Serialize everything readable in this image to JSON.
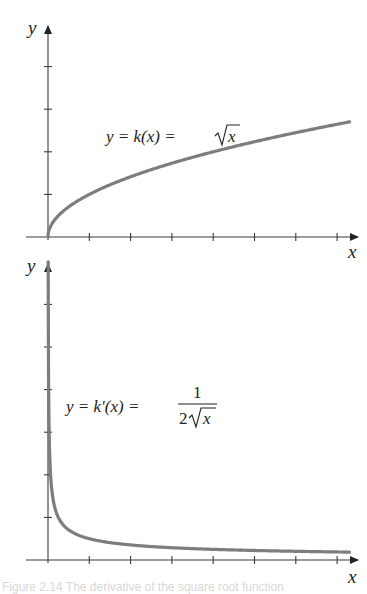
{
  "chart_data": [
    {
      "type": "line",
      "title": "",
      "function": "y = k(x) = √x",
      "label": "y = k(x) = √x",
      "xlabel": "x",
      "ylabel": "y",
      "x_range": [
        0,
        7.3
      ],
      "y_range": [
        0,
        4.9
      ],
      "x_ticks": [
        1,
        2,
        3,
        4,
        5,
        6,
        7
      ],
      "y_ticks": [
        1,
        2,
        3,
        4
      ],
      "tick_labels_shown": false,
      "grid": false,
      "x": [
        0,
        0.05,
        0.25,
        0.5,
        1,
        2,
        3,
        4,
        5,
        6,
        7,
        7.3
      ],
      "y": [
        0,
        0.224,
        0.5,
        0.707,
        1,
        1.414,
        1.732,
        2,
        2.236,
        2.449,
        2.646,
        2.702
      ]
    },
    {
      "type": "line",
      "title": "",
      "function": "y = k'(x) = 1/(2√x)",
      "label": "y = k′(x) = 1/(2√x)",
      "xlabel": "x",
      "ylabel": "y",
      "x_range": [
        0,
        7.3
      ],
      "y_range": [
        0,
        7
      ],
      "x_ticks": [
        1,
        2,
        3,
        4,
        5,
        6,
        7
      ],
      "y_ticks": [
        1,
        2,
        3,
        4,
        5,
        6
      ],
      "tick_labels_shown": false,
      "grid": false,
      "x": [
        0.0051,
        0.01,
        0.02,
        0.05,
        0.1,
        0.25,
        0.5,
        1,
        2,
        3,
        4,
        5,
        6,
        7,
        7.3
      ],
      "y": [
        7,
        5,
        3.536,
        2.236,
        1.581,
        1,
        0.707,
        0.5,
        0.354,
        0.289,
        0.25,
        0.224,
        0.204,
        0.189,
        0.185
      ]
    }
  ],
  "top": {
    "y_axis_label": "y",
    "x_axis_label": "x",
    "eq_lhs": "y = k(x) = ",
    "eq_radicand": "x"
  },
  "bottom": {
    "y_axis_label": "y",
    "x_axis_label": "x",
    "eq_lhs": "y = k′(x) = ",
    "eq_numerator": "1",
    "eq_den_coef": "2",
    "eq_radicand": "x"
  },
  "caption": "Figure 2.14   The derivative of the square root function"
}
